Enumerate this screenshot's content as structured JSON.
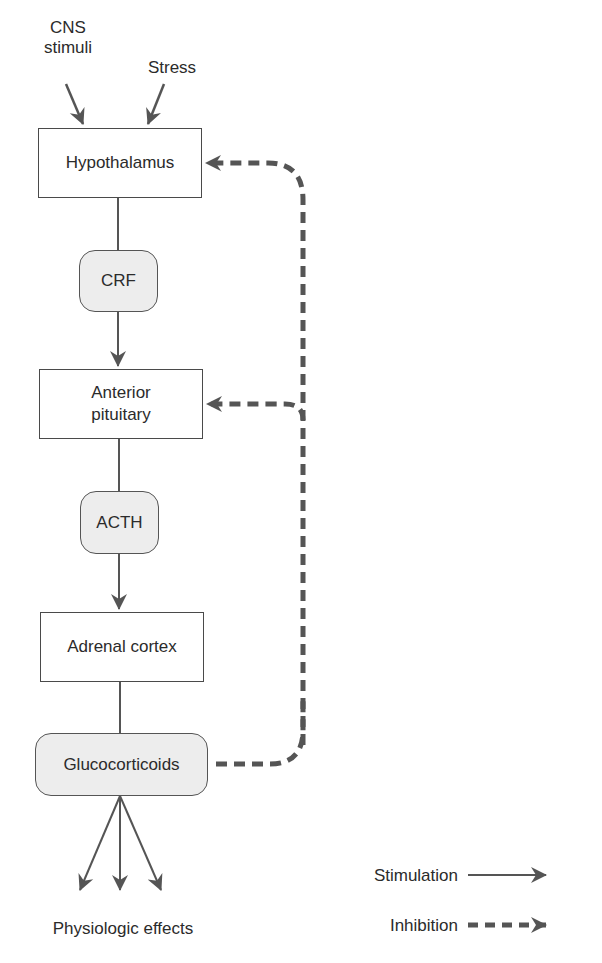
{
  "diagram": {
    "title": "",
    "inputs": [
      {
        "id": "cns",
        "label_line1": "CNS",
        "label_line2": "stimuli"
      },
      {
        "id": "stress",
        "label": "Stress"
      }
    ],
    "nodes": {
      "hypothalamus": {
        "label": "Hypothalamus",
        "shape": "rectangle"
      },
      "crf": {
        "label": "CRF",
        "shape": "rounded"
      },
      "anterior_pituitary": {
        "label_line1": "Anterior",
        "label_line2": "pituitary",
        "shape": "rectangle"
      },
      "acth": {
        "label": "ACTH",
        "shape": "rounded"
      },
      "adrenal_cortex": {
        "label": "Adrenal cortex",
        "shape": "rectangle"
      },
      "glucocorticoids": {
        "label": "Glucocorticoids",
        "shape": "rounded"
      }
    },
    "output": {
      "label": "Physiologic effects"
    },
    "edges": [
      {
        "from": "CNS stimuli",
        "to": "Hypothalamus",
        "type": "stimulation"
      },
      {
        "from": "Stress",
        "to": "Hypothalamus",
        "type": "stimulation"
      },
      {
        "from": "Hypothalamus",
        "to": "CRF",
        "type": "line"
      },
      {
        "from": "CRF",
        "to": "Anterior pituitary",
        "type": "stimulation"
      },
      {
        "from": "Anterior pituitary",
        "to": "ACTH",
        "type": "line"
      },
      {
        "from": "ACTH",
        "to": "Adrenal cortex",
        "type": "stimulation"
      },
      {
        "from": "Adrenal cortex",
        "to": "Glucocorticoids",
        "type": "line"
      },
      {
        "from": "Glucocorticoids",
        "to": "Physiologic effects",
        "type": "stimulation",
        "count": 3
      },
      {
        "from": "Glucocorticoids",
        "to": "Hypothalamus",
        "type": "inhibition"
      },
      {
        "from": "Glucocorticoids",
        "to": "Anterior pituitary",
        "type": "inhibition"
      }
    ],
    "legend": {
      "stimulation": "Stimulation",
      "inhibition": "Inhibition"
    },
    "colors": {
      "arrow": "#555555",
      "box_border": "#4a4a4a",
      "pill_fill": "#ededed",
      "text": "#2b2b2b"
    }
  }
}
